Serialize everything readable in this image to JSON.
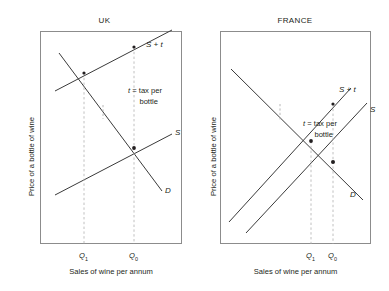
{
  "figure": {
    "axis_labels": {
      "y": "Price of a bottle of wine",
      "x": "Sales of wine per annum"
    },
    "annotation": {
      "symbol": "t",
      "equals": " = tax per",
      "line2": "bottle"
    }
  },
  "panels": [
    {
      "id": "uk",
      "title": "UK",
      "demand_elasticity": "inelastic",
      "curves": [
        {
          "name": "supply-plus-tax",
          "label": "S + t"
        },
        {
          "name": "supply",
          "label": "S"
        },
        {
          "name": "demand",
          "label": "D"
        }
      ],
      "quantities": [
        {
          "name": "q1",
          "label": "Q",
          "sub": "1"
        },
        {
          "name": "q0",
          "label": "Q",
          "sub": "0"
        }
      ]
    },
    {
      "id": "france",
      "title": "FRANCE",
      "demand_elasticity": "elastic",
      "curves": [
        {
          "name": "supply-plus-tax",
          "label": "S + t"
        },
        {
          "name": "supply",
          "label": "S"
        },
        {
          "name": "demand",
          "label": "D"
        }
      ],
      "quantities": [
        {
          "name": "q1",
          "label": "Q",
          "sub": "1"
        },
        {
          "name": "q0",
          "label": "Q",
          "sub": "0"
        }
      ]
    }
  ],
  "colors": {
    "curve": "#3a3a3a",
    "dashed": "#b0b0b0",
    "box_border": "#8c8c8c",
    "text": "#231f20"
  }
}
